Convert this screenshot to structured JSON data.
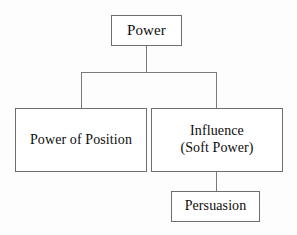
{
  "diagram": {
    "title": "Power",
    "type": "hierarchy-tree",
    "colors": {
      "box_border": "#6e6e6e",
      "box_fill": "#ffffff",
      "connector": "#7a7a7a",
      "text": "#0d0d0d",
      "canvas": "#fdfdfd"
    },
    "nodes": {
      "power": {
        "label": "Power",
        "level": 0
      },
      "power_of_position": {
        "label": "Power of Position",
        "level": 1
      },
      "influence": {
        "label": "Influence",
        "sublabel": "(Soft Power)",
        "level": 1
      },
      "persuasion": {
        "label": "Persuasion",
        "level": 2
      }
    },
    "edges": [
      {
        "from": "power",
        "to": "power_of_position"
      },
      {
        "from": "power",
        "to": "influence"
      },
      {
        "from": "influence",
        "to": "persuasion"
      }
    ]
  }
}
